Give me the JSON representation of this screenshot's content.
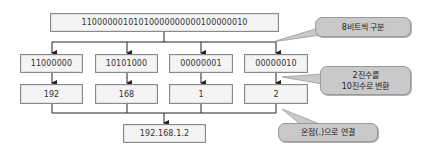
{
  "diagram": {
    "binary_full": "11000000101010000000000100000010",
    "octets": [
      {
        "binary": "11000000",
        "decimal": "192"
      },
      {
        "binary": "10101000",
        "decimal": "168"
      },
      {
        "binary": "00000001",
        "decimal": "1"
      },
      {
        "binary": "00000010",
        "decimal": "2"
      }
    ],
    "result": "192.168.1.2",
    "callouts": {
      "split": "8비트씩 구분",
      "convert_line1": "2진수를",
      "convert_line2": "10진수로 변환",
      "join": "온점(.)으로 연결"
    },
    "colors": {
      "box_fill": "#f4f4f4",
      "box_border": "#8a8a8a",
      "callout_fill": "#c9c9c9",
      "line": "#222222"
    }
  }
}
